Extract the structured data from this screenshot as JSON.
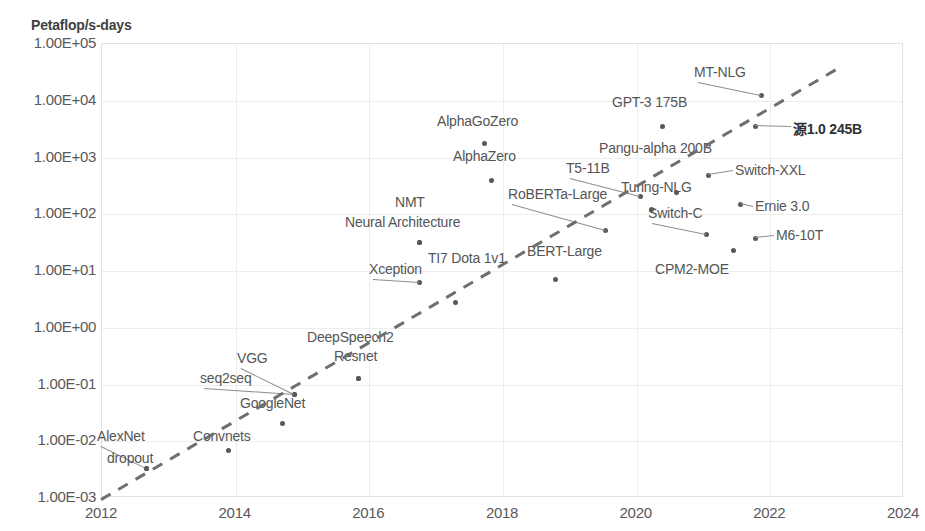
{
  "chart_data": {
    "type": "scatter",
    "title": "",
    "ylabel": "Petaflop/s-days",
    "xlabel": "",
    "xlim": [
      2012,
      2024
    ],
    "ylim": [
      0.001,
      100000
    ],
    "yscale": "log",
    "grid": true,
    "legend": "none",
    "xticks": [
      "2012",
      "2014",
      "2016",
      "2018",
      "2020",
      "2022",
      "2024"
    ],
    "yticks": [
      "1.00E+05",
      "1.00E+04",
      "1.00E+03",
      "1.00E+02",
      "1.00E+01",
      "1.00E+00",
      "1.00E-01",
      "1.00E-02",
      "1.00E-03"
    ],
    "annotation_line": {
      "style": "dashed",
      "label": "",
      "x_start": 2012.0,
      "y_start": 0.0009,
      "x_end": 2023.1,
      "y_end": 40000
    },
    "points": [
      {
        "name": "AlexNet",
        "year": 2012.45,
        "value": 0.0045,
        "px": 146,
        "py": 468,
        "lx": 97,
        "ly": 428,
        "label_pos": "above-left"
      },
      {
        "name": "dropout",
        "year": 2012.4,
        "value": 0.0035,
        "px": 146,
        "py": 468,
        "lx": 107,
        "ly": 450,
        "label_pos": "below-left"
      },
      {
        "name": "Convnets",
        "year": 2013.9,
        "value": 0.0075,
        "px": 228,
        "py": 450,
        "lx": 193,
        "ly": 428,
        "label_pos": "above"
      },
      {
        "name": "seq2seq",
        "year": 2014.5,
        "value": 0.055,
        "px": 294,
        "py": 394,
        "lx": 200,
        "ly": 370,
        "label_pos": "left"
      },
      {
        "name": "VGG",
        "year": 2014.5,
        "value": 0.065,
        "px": 294,
        "py": 394,
        "lx": 237,
        "ly": 350,
        "label_pos": "above-left"
      },
      {
        "name": "GoogleNet",
        "year": 2014.7,
        "value": 0.025,
        "px": 282,
        "py": 423,
        "lx": 240,
        "ly": 395,
        "label_pos": "above"
      },
      {
        "name": "DeepSpeech2",
        "year": 2015.85,
        "value": 0.12,
        "px": 358,
        "py": 378,
        "lx": 307,
        "ly": 329,
        "label_pos": "above"
      },
      {
        "name": "Resnet",
        "year": 2015.85,
        "value": 0.12,
        "px": 358,
        "py": 378,
        "lx": 334,
        "ly": 348,
        "label_pos": "above"
      },
      {
        "name": "Xception",
        "year": 2016.75,
        "value": 4.5,
        "px": 419,
        "py": 282,
        "lx": 369,
        "ly": 261,
        "label_pos": "above-left"
      },
      {
        "name": "Neural Architecture",
        "year": 2016.75,
        "value": 17.0,
        "px": 419,
        "py": 242,
        "lx": 345,
        "ly": 214,
        "label_pos": "above"
      },
      {
        "name": "NMT",
        "year": 2016.75,
        "value": 17.0,
        "px": 419,
        "py": 242,
        "lx": 395,
        "ly": 194,
        "label_pos": "above"
      },
      {
        "name": "TI7 Dota 1v1",
        "year": 2017.5,
        "value": 2.0,
        "px": 455,
        "py": 302,
        "lx": 428,
        "ly": 250,
        "label_pos": "above"
      },
      {
        "name": "AlphaZero",
        "year": 2017.8,
        "value": 400.0,
        "px": 491,
        "py": 180,
        "lx": 453,
        "ly": 148,
        "label_pos": "above"
      },
      {
        "name": "AlphaGoZero",
        "year": 2017.75,
        "value": 1800.0,
        "px": 484,
        "py": 143,
        "lx": 437,
        "ly": 113,
        "label_pos": "above"
      },
      {
        "name": "BERT-Large",
        "year": 2018.7,
        "value": 6.5,
        "px": 555,
        "py": 279,
        "lx": 527,
        "ly": 243,
        "label_pos": "above"
      },
      {
        "name": "RoBERTa-Large",
        "year": 2019.5,
        "value": 45.0,
        "px": 605,
        "py": 230,
        "lx": 508,
        "ly": 186,
        "label_pos": "above-left"
      },
      {
        "name": "T5-11B",
        "year": 2020.0,
        "value": 240.0,
        "px": 640,
        "py": 196,
        "lx": 566,
        "ly": 160,
        "label_pos": "above-left"
      },
      {
        "name": "Turing-NLG",
        "year": 2020.2,
        "value": 150.0,
        "px": 651,
        "py": 209,
        "lx": 621,
        "ly": 179,
        "label_pos": "above-right"
      },
      {
        "name": "GPT-3 175B",
        "year": 2020.4,
        "value": 3500.0,
        "px": 662,
        "py": 126,
        "lx": 612,
        "ly": 94,
        "label_pos": "above"
      },
      {
        "name": "Pangu-alpha 200B",
        "year": 2020.6,
        "value": 290.0,
        "px": 676,
        "py": 192,
        "lx": 599,
        "ly": 140,
        "label_pos": "above"
      },
      {
        "name": "Switch-C",
        "year": 2021.0,
        "value": 30.0,
        "px": 706,
        "py": 234,
        "lx": 648,
        "ly": 205,
        "label_pos": "above-left"
      },
      {
        "name": "Switch-XXL",
        "year": 2021.1,
        "value": 400.0,
        "px": 708,
        "py": 175,
        "lx": 735,
        "ly": 162,
        "label_pos": "right"
      },
      {
        "name": "Ernie 3.0",
        "year": 2021.45,
        "value": 130.0,
        "px": 740,
        "py": 204,
        "lx": 755,
        "ly": 198,
        "label_pos": "right"
      },
      {
        "name": "M6-10T",
        "year": 2021.65,
        "value": 20.0,
        "px": 755,
        "py": 238,
        "lx": 776,
        "ly": 227,
        "label_pos": "right"
      },
      {
        "name": "CPM2-MOE",
        "year": 2021.3,
        "value": 12.0,
        "px": 733,
        "py": 250,
        "lx": 655,
        "ly": 261,
        "label_pos": "below-left"
      },
      {
        "name": "MT-NLG",
        "year": 2021.65,
        "value": 7000.0,
        "px": 761,
        "py": 95,
        "lx": 694,
        "ly": 64,
        "label_pos": "above-left"
      },
      {
        "name": "源1.0 245B",
        "year": 2021.5,
        "value": 3500.0,
        "px": 755,
        "py": 126,
        "lx": 793,
        "ly": 118,
        "label_pos": "right",
        "bold": true
      }
    ]
  },
  "axis": {
    "y_title": "Petaflop/s-days"
  }
}
